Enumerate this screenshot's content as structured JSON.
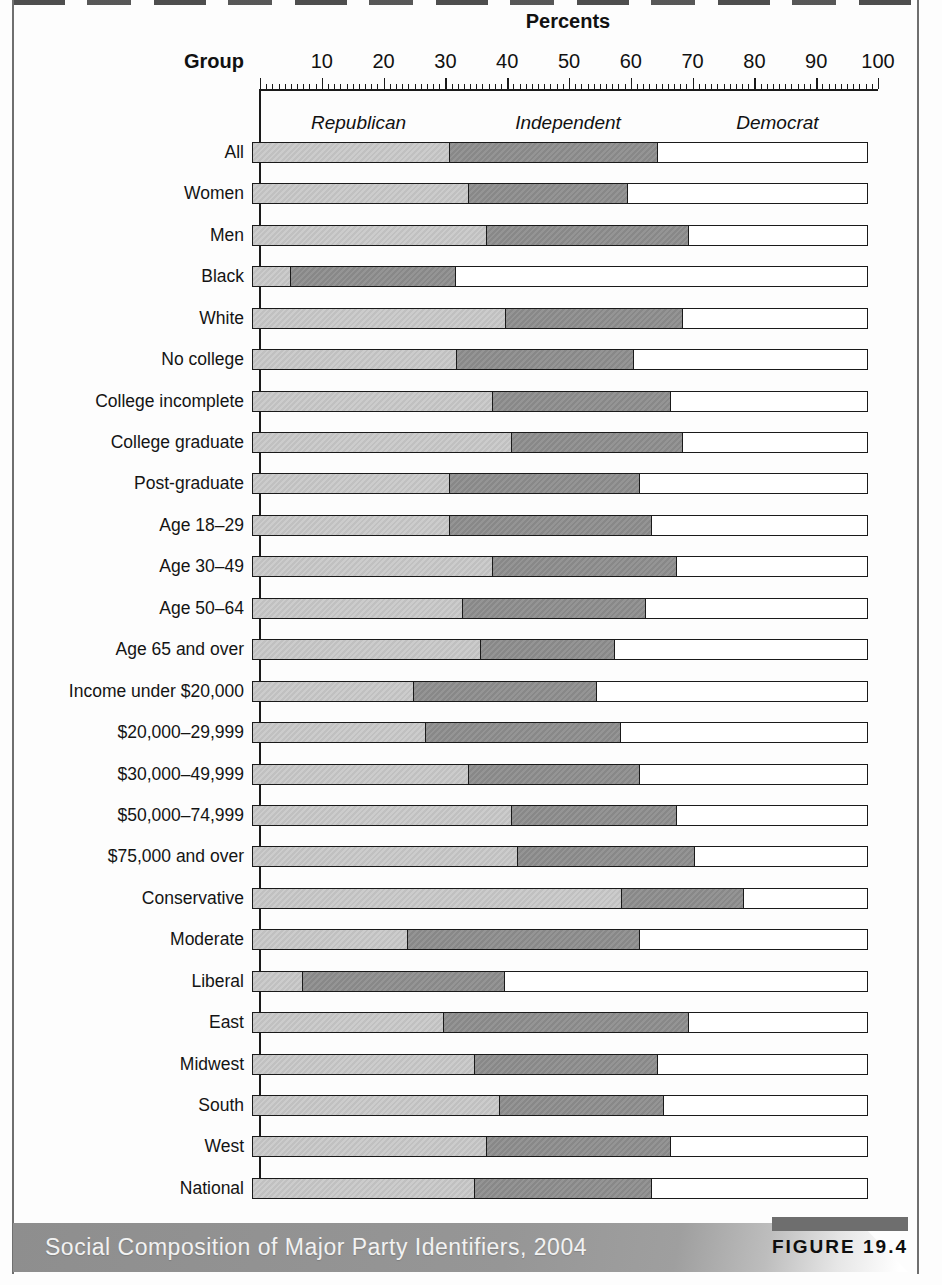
{
  "page": {
    "axis_title": "Percents",
    "group_label": "Group",
    "caption": "Social Composition of Major Party Identifiers, 2004",
    "figure_label": "FIGURE 19.4"
  },
  "chart_data": {
    "type": "bar",
    "stacked": true,
    "orientation": "horizontal",
    "title": "Social Composition of Major Party Identifiers, 2004",
    "xlabel": "Percents",
    "xlim": [
      0,
      100
    ],
    "x_ticks": [
      10,
      20,
      30,
      40,
      50,
      60,
      70,
      80,
      90,
      100
    ],
    "grid": false,
    "legend_position": "inside-top",
    "legend": [
      "Republican",
      "Independent",
      "Democrat"
    ],
    "colors": {
      "republican": "#c9c9c9",
      "independent": "#8f8f8f",
      "democrat": "#ffffff",
      "bar_border": "#1a1a1a"
    },
    "categories": [
      "All",
      "Women",
      "Men",
      "Black",
      "White",
      "No college",
      "College incomplete",
      "College graduate",
      "Post-graduate",
      "Age 18–29",
      "Age 30–49",
      "Age 50–64",
      "Age 65 and over",
      "Income under $20,000",
      "$20,000–29,999",
      "$30,000–49,999",
      "$50,000–74,999",
      "$75,000 and over",
      "Conservative",
      "Moderate",
      "Liberal",
      "East",
      "Midwest",
      "South",
      "West",
      "National"
    ],
    "series": [
      {
        "name": "Republican",
        "values": [
          32,
          35,
          38,
          6,
          41,
          33,
          39,
          42,
          32,
          32,
          39,
          34,
          37,
          26,
          28,
          35,
          42,
          43,
          60,
          25,
          8,
          31,
          36,
          40,
          38,
          36
        ]
      },
      {
        "name": "Independent",
        "values": [
          34,
          26,
          33,
          27,
          29,
          29,
          29,
          28,
          31,
          33,
          30,
          30,
          22,
          30,
          32,
          28,
          27,
          29,
          20,
          38,
          33,
          40,
          30,
          27,
          30,
          29
        ]
      },
      {
        "name": "Democrat",
        "values": [
          34,
          39,
          29,
          67,
          30,
          38,
          32,
          30,
          37,
          35,
          31,
          36,
          41,
          44,
          40,
          37,
          31,
          28,
          20,
          37,
          59,
          29,
          34,
          33,
          32,
          35
        ]
      }
    ],
    "series_label_positions_pct": [
      16,
      50,
      84
    ]
  }
}
